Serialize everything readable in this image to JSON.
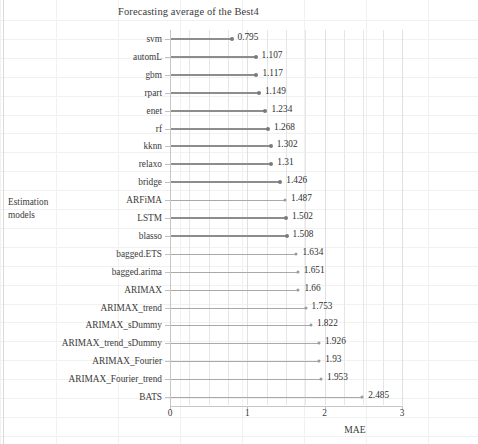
{
  "chart_data": {
    "type": "bar",
    "orientation": "horizontal",
    "style": "lollipop",
    "title": "Forecasting average of the Best4",
    "xlabel": "MAE",
    "ylabel": "Estimation\nmodels",
    "ylabel_line1": "Estimation",
    "ylabel_line2": "models",
    "xlim": [
      0,
      3
    ],
    "xticks": [
      0,
      1,
      2,
      3
    ],
    "xtick_labels": [
      "0",
      "1",
      "2",
      "3"
    ],
    "grid": true,
    "grid_axis": "x",
    "grid_minor_step": 0.25,
    "legend": null,
    "bar_color": "#8d8d8d",
    "accent_color": "#7a7a7a",
    "categories": [
      "svm",
      "automL",
      "gbm",
      "rpart",
      "enet",
      "rf",
      "kknn",
      "relaxo",
      "bridge",
      "ARFiMA",
      "LSTM",
      "blasso",
      "bagged.ETS",
      "bagged.arima",
      "ARIMAX",
      "ARIMAX_trend",
      "ARIMAX_sDummy",
      "ARIMAX_trend_sDummy",
      "ARIMAX_Fourier",
      "ARIMAX_Fourier_trend",
      "BATS"
    ],
    "values": [
      0.795,
      1.107,
      1.117,
      1.149,
      1.234,
      1.268,
      1.302,
      1.31,
      1.426,
      1.487,
      1.502,
      1.508,
      1.634,
      1.651,
      1.66,
      1.753,
      1.822,
      1.926,
      1.93,
      1.953,
      2.485
    ],
    "value_labels": [
      "0.795",
      "1.107",
      "1.117",
      "1.149",
      "1.234",
      "1.268",
      "1.302",
      "1.31",
      "1.426",
      "1.487",
      "1.502",
      "1.508",
      "1.634",
      "1.651",
      "1.66",
      "1.753",
      "1.822",
      "1.926",
      "1.93",
      "1.953",
      "2.485"
    ],
    "emphasis": [
      true,
      true,
      true,
      true,
      true,
      true,
      true,
      true,
      true,
      false,
      true,
      true,
      false,
      false,
      false,
      false,
      false,
      false,
      false,
      false,
      false
    ]
  }
}
